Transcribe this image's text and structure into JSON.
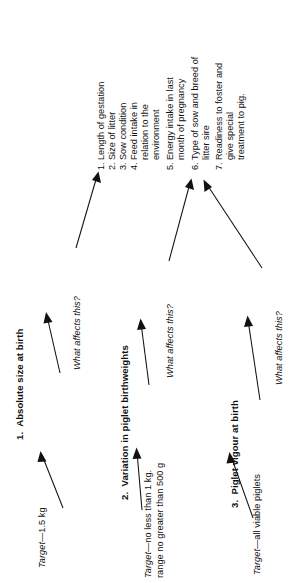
{
  "diagram": {
    "orientation": "rotated-90-ccw",
    "nodes": [
      {
        "id": "node-1",
        "heading": "1.  Absolute size at birth",
        "target_label": "Target",
        "target_value": "—1.5 kg",
        "target_line2": "",
        "question": "What affects this?"
      },
      {
        "id": "node-2",
        "heading": "2.  Variation in piglet birthweights",
        "target_label": "Target",
        "target_value": "—no less than 1 kg.",
        "target_line2": "range no greater than 500 g",
        "question": "What affects this?"
      },
      {
        "id": "node-3",
        "heading": "3.  Piglet vigour at birth",
        "target_label": "Target",
        "target_value": "—all viable piglets",
        "target_line2": "",
        "question": "What affects this?"
      }
    ],
    "factors": [
      {
        "num": "1.",
        "lines": [
          "Length of gestation"
        ]
      },
      {
        "num": "2.",
        "lines": [
          "Size of litter"
        ]
      },
      {
        "num": "3.",
        "lines": [
          "Sow condition"
        ]
      },
      {
        "num": "4.",
        "lines": [
          "Feed intake in",
          "relation to the",
          "environment"
        ]
      },
      {
        "num": "5.",
        "lines": [
          "Energy intake in last",
          "month of pregnancy"
        ]
      },
      {
        "num": "6.",
        "lines": [
          "Type of sow and breed of",
          "litter sire"
        ]
      },
      {
        "num": "7.",
        "lines": [
          "Readiness to foster and",
          "give special",
          "treatment to pig."
        ]
      }
    ],
    "colors": {
      "ink": "#111111",
      "background": "#ffffff"
    }
  }
}
